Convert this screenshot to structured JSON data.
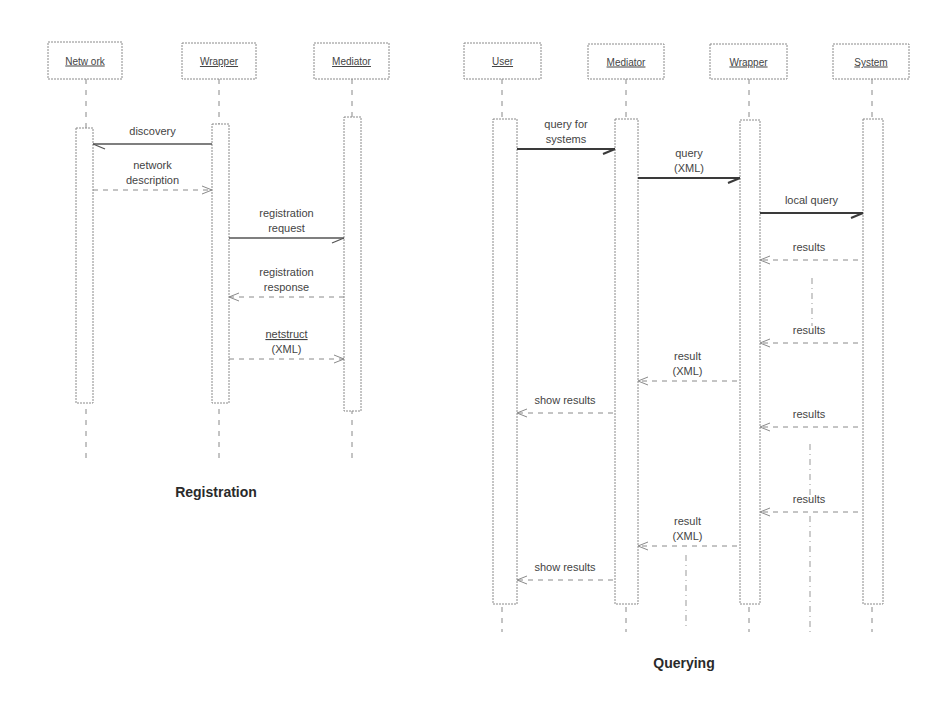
{
  "diagrams": [
    {
      "id": "registration",
      "caption": "Registration",
      "caption_pos": [
        216,
        497
      ],
      "lifeline_end": 460,
      "participants": [
        {
          "name": "Netw ork",
          "x": 86,
          "box": [
            48,
            42,
            74,
            37
          ],
          "activation": [
            76,
            128,
            17,
            275
          ]
        },
        {
          "name": "Wrapper",
          "x": 219,
          "box": [
            182,
            43,
            74,
            36
          ],
          "activation": [
            212,
            124,
            17,
            279
          ]
        },
        {
          "name": "Mediator",
          "x": 352,
          "box": [
            314,
            43,
            75,
            36
          ],
          "activation": [
            344,
            117,
            17,
            294
          ]
        }
      ],
      "messages": [
        {
          "label": [
            "discovery"
          ],
          "from": 212,
          "to": 93,
          "y": 144,
          "style": "solid-thin",
          "underline": false
        },
        {
          "label": [
            "network",
            "description"
          ],
          "from": 93,
          "to": 212,
          "y": 190,
          "style": "dashed",
          "underline": false
        },
        {
          "label": [
            "registration",
            "request"
          ],
          "from": 229,
          "to": 344,
          "y": 238,
          "style": "solid-thin",
          "underline": false
        },
        {
          "label": [
            "registration",
            "response"
          ],
          "from": 344,
          "to": 229,
          "y": 297,
          "style": "dashed",
          "underline": false
        },
        {
          "label": [
            "netstruct",
            "(XML)"
          ],
          "from": 229,
          "to": 344,
          "y": 359,
          "style": "dashed",
          "underline": true
        }
      ],
      "guides": []
    },
    {
      "id": "querying",
      "caption": "Querying",
      "caption_pos": [
        684,
        668
      ],
      "lifeline_end": 632,
      "participants": [
        {
          "name": "User",
          "x": 502,
          "box": [
            464,
            43,
            77,
            36
          ],
          "activation": [
            493,
            119,
            24,
            485
          ]
        },
        {
          "name": "Mediator",
          "x": 626,
          "box": [
            588,
            44,
            76,
            35
          ],
          "activation": [
            615,
            119,
            23,
            485
          ]
        },
        {
          "name": "Wrapper",
          "x": 749,
          "box": [
            710,
            44,
            77,
            35
          ],
          "activation": [
            740,
            120,
            20,
            484
          ]
        },
        {
          "name": "System",
          "x": 872,
          "box": [
            833,
            44,
            76,
            35
          ],
          "activation": [
            863,
            119,
            20,
            485
          ]
        }
      ],
      "messages": [
        {
          "label": [
            "query for",
            "systems"
          ],
          "from": 517,
          "to": 615,
          "y": 149,
          "style": "solid",
          "underline": false
        },
        {
          "label": [
            "query",
            "(XML)"
          ],
          "from": 638,
          "to": 740,
          "y": 178,
          "style": "solid",
          "underline": false
        },
        {
          "label": [
            "local query"
          ],
          "from": 760,
          "to": 863,
          "y": 213,
          "style": "solid",
          "underline": false
        },
        {
          "label": [
            "results"
          ],
          "from": 858,
          "to": 760,
          "y": 260,
          "style": "dashed",
          "underline": false
        },
        {
          "label": [
            "results"
          ],
          "from": 858,
          "to": 760,
          "y": 343,
          "style": "dashed",
          "underline": false
        },
        {
          "label": [
            "result",
            "(XML)"
          ],
          "from": 737,
          "to": 638,
          "y": 381,
          "style": "dashed",
          "underline": false
        },
        {
          "label": [
            "show results"
          ],
          "from": 613,
          "to": 517,
          "y": 413,
          "style": "dashed",
          "underline": false
        },
        {
          "label": [
            "results"
          ],
          "from": 858,
          "to": 760,
          "y": 427,
          "style": "dashed",
          "underline": false
        },
        {
          "label": [
            "results"
          ],
          "from": 858,
          "to": 760,
          "y": 512,
          "style": "dashed",
          "underline": false
        },
        {
          "label": [
            "result",
            "(XML)"
          ],
          "from": 737,
          "to": 638,
          "y": 546,
          "style": "dashed",
          "underline": false
        },
        {
          "label": [
            "show results"
          ],
          "from": 613,
          "to": 517,
          "y": 580,
          "style": "dashed",
          "underline": false
        }
      ],
      "guides": [
        {
          "x": 812,
          "y1": 278,
          "y2": 326
        },
        {
          "x": 810,
          "y1": 444,
          "y2": 500
        },
        {
          "x": 810,
          "y1": 516,
          "y2": 632
        },
        {
          "x": 686,
          "y1": 555,
          "y2": 630
        }
      ]
    }
  ]
}
